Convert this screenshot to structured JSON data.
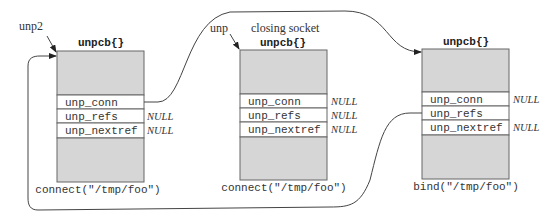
{
  "diagram": {
    "structs": [
      {
        "title": "unpcb{}",
        "pointer_label": "unp2",
        "extra_label": "",
        "fields": [
          {
            "name": "unp_conn",
            "value": ""
          },
          {
            "name": "unp_refs",
            "value": "NULL"
          },
          {
            "name": "unp_nextref",
            "value": "NULL"
          }
        ],
        "caption": "connect(\"/tmp/foo\")"
      },
      {
        "title": "unpcb{}",
        "pointer_label": "unp",
        "extra_label": "closing socket",
        "fields": [
          {
            "name": "unp_conn",
            "value": "NULL"
          },
          {
            "name": "unp_refs",
            "value": "NULL"
          },
          {
            "name": "unp_nextref",
            "value": "NULL"
          }
        ],
        "caption": "connect(\"/tmp/foo\")"
      },
      {
        "title": "unpcb{}",
        "pointer_label": "",
        "extra_label": "",
        "fields": [
          {
            "name": "unp_conn",
            "value": "NULL"
          },
          {
            "name": "unp_refs",
            "value": ""
          },
          {
            "name": "unp_nextref",
            "value": "NULL"
          }
        ],
        "caption": "bind(\"/tmp/foo\")"
      }
    ],
    "arrows": [
      {
        "from": "struct-1.unp_conn",
        "to": "struct-3"
      },
      {
        "from": "struct-3.unp_refs",
        "to": "struct-1"
      }
    ]
  }
}
